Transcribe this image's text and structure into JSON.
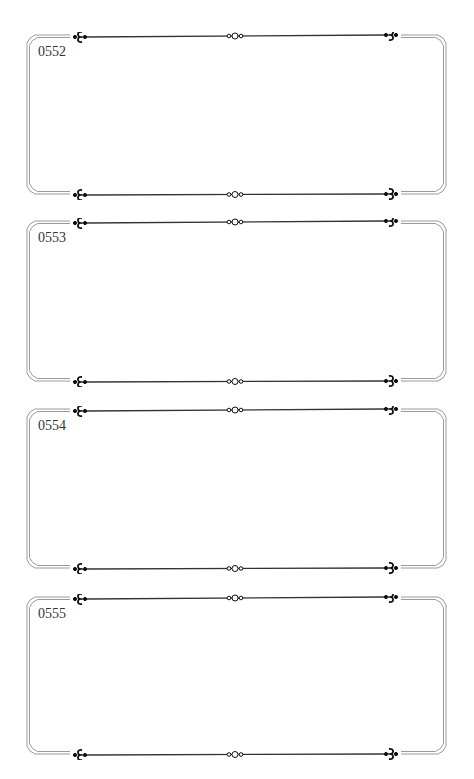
{
  "page": {
    "type": "label-sheet",
    "frame_count": 4
  },
  "frames": [
    {
      "label": "0552",
      "top": 36,
      "height": 158
    },
    {
      "label": "0553",
      "top": 222,
      "height": 159
    },
    {
      "label": "0554",
      "top": 410,
      "height": 158
    },
    {
      "label": "0555",
      "top": 598,
      "height": 156
    }
  ],
  "style": {
    "line_color": "#333333",
    "border_color": "#9a9a9a",
    "ornament_color": "#111111"
  },
  "ornaments": {
    "left": "fleur-left-icon",
    "center": "triple-ring-icon",
    "right": "fleur-right-icon"
  }
}
